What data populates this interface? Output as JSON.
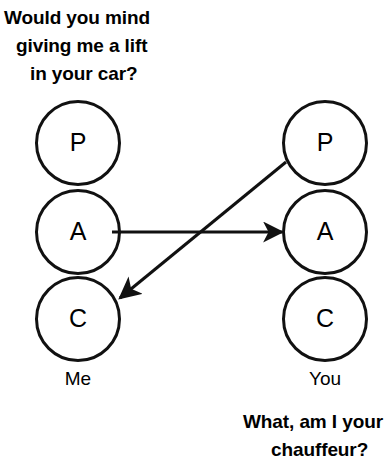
{
  "diagram": {
    "background_color": "#ffffff",
    "stroke_color": "#111111",
    "captions": {
      "top": {
        "line1": "Would you mind",
        "line2": "giving me a lift",
        "line3": "in your car?"
      },
      "bottom": {
        "line1": "What, am I your",
        "line2": "chauffeur?"
      }
    },
    "columns": [
      {
        "name": "me",
        "label": "Me",
        "states": [
          {
            "key": "parent",
            "letter": "P"
          },
          {
            "key": "adult",
            "letter": "A"
          },
          {
            "key": "child",
            "letter": "C"
          }
        ]
      },
      {
        "name": "you",
        "label": "You",
        "states": [
          {
            "key": "parent",
            "letter": "P"
          },
          {
            "key": "adult",
            "letter": "A"
          },
          {
            "key": "child",
            "letter": "C"
          }
        ]
      }
    ],
    "arrows": [
      {
        "name": "stimulus-arrow",
        "from": "me-adult",
        "to": "you-adult",
        "direction": "left-to-right",
        "style": "horizontal"
      },
      {
        "name": "response-arrow",
        "from": "you-parent",
        "to": "me-child",
        "direction": "right-to-left",
        "style": "diagonal"
      }
    ]
  }
}
